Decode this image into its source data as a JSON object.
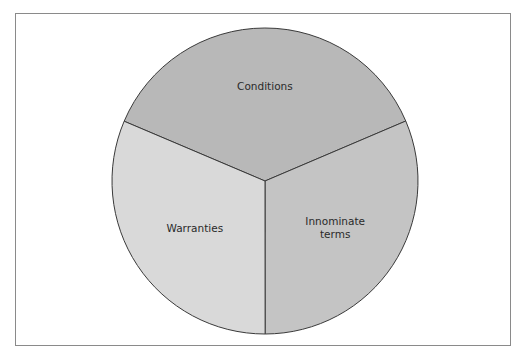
{
  "chart_data": {
    "type": "pie",
    "title": "",
    "start_angle_deg": 293,
    "direction": "clockwise",
    "slices": [
      {
        "label": "Conditions",
        "label_lines": [
          "Conditions"
        ],
        "value": 37.2,
        "color": "#b8b8b8"
      },
      {
        "label": "Innominate terms",
        "label_lines": [
          "Innominate",
          "terms"
        ],
        "value": 31.4,
        "color": "#c4c4c4"
      },
      {
        "label": "Warranties",
        "label_lines": [
          "Warranties"
        ],
        "value": 31.4,
        "color": "#d9d9d9"
      }
    ],
    "stroke_color": "#3a3a3a",
    "frame_color": "#8a8a8a"
  }
}
